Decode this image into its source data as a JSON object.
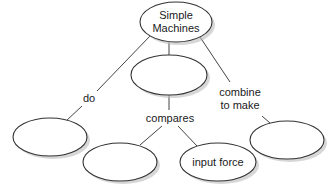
{
  "diagram": {
    "type": "concept-map",
    "nodes": [
      {
        "id": "root",
        "label_line1": "Simple",
        "label_line2": "Machines",
        "cx": 176,
        "cy": 22,
        "rx": 36,
        "ry": 20
      },
      {
        "id": "middle",
        "label": "",
        "cx": 169,
        "cy": 75,
        "rx": 38,
        "ry": 20
      },
      {
        "id": "left",
        "label": "",
        "cx": 50,
        "cy": 137,
        "rx": 37,
        "ry": 19
      },
      {
        "id": "bottom-left",
        "label": "",
        "cx": 120,
        "cy": 162,
        "rx": 37,
        "ry": 19
      },
      {
        "id": "bottom-right",
        "label": "input force",
        "cx": 218,
        "cy": 162,
        "rx": 38,
        "ry": 19
      },
      {
        "id": "right",
        "label": "",
        "cx": 287,
        "cy": 140,
        "rx": 37,
        "ry": 19
      }
    ],
    "links": [
      {
        "from": "root",
        "to": "left",
        "label": "do"
      },
      {
        "from": "root",
        "to": "middle",
        "label": ""
      },
      {
        "from": "root",
        "to": "right",
        "label_line1": "combine",
        "label_line2": "to make"
      },
      {
        "from": "middle",
        "to": "bottom-left",
        "label": "compares"
      },
      {
        "from": "middle",
        "to": "bottom-right",
        "label": ""
      }
    ]
  },
  "labels": {
    "root_line1": "Simple",
    "root_line2": "Machines",
    "input_force": "input force",
    "do": "do",
    "compares": "compares",
    "combine_line1": "combine",
    "combine_line2": "to make"
  }
}
